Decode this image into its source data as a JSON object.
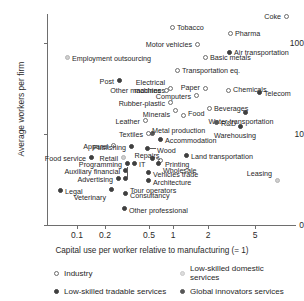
{
  "chart_data": {
    "type": "scatter",
    "title": "",
    "xlabel": "Capital use per worker relative to manufacturing (= 1)",
    "ylabel": "Average workers per firm",
    "xscale": "log",
    "yscale": "log",
    "grid": false,
    "legend_position": "below",
    "xticks": [
      "0.1",
      "0.2",
      "0.5",
      "1",
      "2",
      "5"
    ],
    "xtick_values": [
      0.1,
      0.2,
      0.5,
      1,
      2,
      5
    ],
    "yticks": [
      "0",
      "10",
      "100"
    ],
    "ytick_values": [
      0,
      10,
      100
    ],
    "legend": [
      {
        "key": "industry",
        "label": "Industry"
      },
      {
        "key": "lowdom",
        "label": "Low-skilled domestic services"
      },
      {
        "key": "lowtrade",
        "label": "Low-skilled tradable services"
      },
      {
        "key": "global",
        "label": "Global innovators services"
      }
    ],
    "series": [
      {
        "name": "Industry",
        "key": "industry",
        "points": [
          {
            "label": "Coke",
            "x": 6.8,
            "y": 135,
            "px": 286,
            "py": 16,
            "lx": 281,
            "ly": 13,
            "anchor": "r"
          },
          {
            "label": "Tobacco",
            "x": 0.92,
            "y": 118,
            "px": 172,
            "py": 27,
            "lx": 177,
            "ly": 24,
            "anchor": "l"
          },
          {
            "label": "Pharma",
            "x": 3.0,
            "y": 110,
            "px": 230,
            "py": 33,
            "lx": 235,
            "ly": 30,
            "anchor": "l"
          },
          {
            "label": "Motor vehicles",
            "x": 1.05,
            "y": 95,
            "px": 197,
            "py": 44,
            "lx": 192,
            "ly": 41,
            "anchor": "r"
          },
          {
            "label": "Basic metals",
            "x": 1.65,
            "y": 82,
            "px": 205,
            "py": 57,
            "lx": 210,
            "ly": 54,
            "anchor": "l"
          },
          {
            "label": "Transportation eq.",
            "x": 0.95,
            "y": 68,
            "px": 177,
            "py": 70,
            "lx": 182,
            "ly": 67,
            "anchor": "l"
          },
          {
            "label": "Electrical machines",
            "x": 0.62,
            "y": 48,
            "px": 170,
            "py": 88,
            "lx": 165,
            "ly": 79,
            "anchor": "r2"
          },
          {
            "label": "Paper",
            "x": 1.35,
            "y": 45,
            "px": 205,
            "py": 88,
            "lx": 200,
            "ly": 84,
            "anchor": "r"
          },
          {
            "label": "Other machines",
            "x": 0.58,
            "y": 43,
            "px": 166,
            "py": 90,
            "lx": 161,
            "ly": 87,
            "anchor": "r"
          },
          {
            "label": "Computers",
            "x": 0.78,
            "y": 40,
            "px": 196,
            "py": 95,
            "lx": 191,
            "ly": 93,
            "anchor": "r"
          },
          {
            "label": "Chemicals",
            "x": 2.6,
            "y": 45,
            "px": 228,
            "py": 90,
            "lx": 233,
            "ly": 86,
            "anchor": "l"
          },
          {
            "label": "Rubber-plastic",
            "x": 0.63,
            "y": 30,
            "px": 170,
            "py": 102,
            "lx": 165,
            "ly": 100,
            "anchor": "r"
          },
          {
            "label": "Minerals",
            "x": 0.72,
            "y": 25,
            "px": 175,
            "py": 110,
            "lx": 170,
            "ly": 111,
            "anchor": "r"
          },
          {
            "label": "Food",
            "x": 0.84,
            "y": 22,
            "px": 183,
            "py": 115,
            "lx": 188,
            "ly": 110,
            "anchor": "l"
          },
          {
            "label": "Beverages",
            "x": 1.95,
            "y": 24,
            "px": 209,
            "py": 108,
            "lx": 214,
            "ly": 105,
            "anchor": "l"
          },
          {
            "label": "Leather",
            "x": 0.44,
            "y": 13,
            "px": 145,
            "py": 120,
            "lx": 140,
            "ly": 118,
            "anchor": "r"
          },
          {
            "label": "Textiles",
            "x": 0.45,
            "y": 10.5,
            "px": 148,
            "py": 133,
            "lx": 143,
            "ly": 131,
            "anchor": "r"
          },
          {
            "label": "Apparel",
            "x": 0.3,
            "y": 8.5,
            "px": 113,
            "py": 145,
            "lx": 108,
            "ly": 143,
            "anchor": "r"
          },
          {
            "label": "Printing",
            "x": 0.62,
            "y": 7.0,
            "px": 160,
            "py": 160,
            "lx": 165,
            "ly": 161,
            "anchor": "l"
          }
        ]
      },
      {
        "name": "Low-skilled domestic services",
        "key": "lowdom",
        "points": [
          {
            "label": "Employment outsourcing",
            "x": 0.13,
            "y": 82,
            "px": 67,
            "py": 57,
            "lx": 72,
            "ly": 55,
            "anchor": "l"
          },
          {
            "label": "Leasing",
            "x": 5.9,
            "y": 5.2,
            "px": 277,
            "py": 180,
            "lx": 272,
            "ly": 170,
            "anchor": "r"
          },
          {
            "label": "Retail",
            "x": 0.33,
            "y": 7.2,
            "px": 123,
            "py": 157,
            "lx": 118,
            "ly": 155,
            "anchor": "r"
          }
        ]
      },
      {
        "name": "Low-skilled tradable services",
        "key": "lowtrade",
        "points": [
          {
            "label": "Post",
            "x": 0.24,
            "y": 50,
            "px": 119,
            "py": 80,
            "lx": 114,
            "ly": 78,
            "anchor": "r"
          },
          {
            "label": "Air transportation",
            "x": 2.95,
            "y": 88,
            "px": 229,
            "py": 52,
            "lx": 234,
            "ly": 49,
            "anchor": "l"
          },
          {
            "label": "Telecom",
            "x": 5.0,
            "y": 37,
            "px": 259,
            "py": 92,
            "lx": 264,
            "ly": 90,
            "anchor": "l"
          },
          {
            "label": "Water transportation",
            "x": 3.8,
            "y": 17,
            "px": 245,
            "py": 112,
            "lx": 241,
            "ly": 118,
            "anchor": "c"
          },
          {
            "label": "Warehousing",
            "x": 3.3,
            "y": 12,
            "px": 240,
            "py": 126,
            "lx": 235,
            "ly": 132,
            "anchor": "c"
          },
          {
            "label": "Accommodation",
            "x": 0.57,
            "y": 9.5,
            "px": 160,
            "py": 139,
            "lx": 165,
            "ly": 137,
            "anchor": "l"
          },
          {
            "label": "Wood",
            "x": 0.5,
            "y": 8.0,
            "px": 147,
            "py": 148,
            "lx": 157,
            "ly": 147,
            "anchor": "l"
          },
          {
            "label": "Publishing",
            "x": 0.37,
            "y": 8.4,
            "px": 131,
            "py": 146,
            "lx": 126,
            "ly": 144,
            "anchor": "r"
          },
          {
            "label": "Repairs",
            "x": 0.45,
            "y": 7.3,
            "px": 152,
            "py": 158,
            "lx": 147,
            "ly": 152,
            "anchor": "c"
          },
          {
            "label": "Land transportation",
            "x": 1.2,
            "y": 7.4,
            "px": 186,
            "py": 155,
            "lx": 191,
            "ly": 153,
            "anchor": "l"
          },
          {
            "label": "Food service",
            "x": 0.14,
            "y": 7.0,
            "px": 91,
            "py": 157,
            "lx": 86,
            "ly": 155,
            "anchor": "r"
          },
          {
            "label": "Programming",
            "x": 0.33,
            "y": 6.6,
            "px": 127,
            "py": 163,
            "lx": 122,
            "ly": 161,
            "anchor": "r"
          },
          {
            "label": "IT",
            "x": 0.42,
            "y": 6.6,
            "px": 134,
            "py": 163,
            "lx": 139,
            "ly": 161,
            "anchor": "l"
          },
          {
            "label": "Wholesale",
            "x": 0.64,
            "y": 6.2,
            "px": 158,
            "py": 163,
            "lx": 163,
            "ly": 167,
            "anchor": "l"
          },
          {
            "label": "Auxiliary financial",
            "x": 0.3,
            "y": 5.8,
            "px": 125,
            "py": 170,
            "lx": 120,
            "ly": 168,
            "anchor": "r"
          },
          {
            "label": "Vehicles trade",
            "x": 0.45,
            "y": 5.6,
            "px": 148,
            "py": 172,
            "lx": 153,
            "ly": 171,
            "anchor": "l"
          },
          {
            "label": "Advertising",
            "x": 0.27,
            "y": 5.0,
            "px": 118,
            "py": 178,
            "lx": 113,
            "ly": 176,
            "anchor": "r"
          },
          {
            "label": "Architecture",
            "x": 0.46,
            "y": 4.9,
            "px": 148,
            "py": 180,
            "lx": 153,
            "ly": 179,
            "anchor": "l"
          },
          {
            "label": "Legal",
            "x": 0.075,
            "y": 4.0,
            "px": 60,
            "py": 190,
            "lx": 65,
            "ly": 188,
            "anchor": "l"
          },
          {
            "label": "Veterinary",
            "x": 0.18,
            "y": 4.1,
            "px": 111,
            "py": 189,
            "lx": 106,
            "ly": 194,
            "anchor": "r"
          },
          {
            "label": "Tour operators",
            "x": 0.31,
            "y": 4.3,
            "px": 125,
            "py": 178,
            "lx": 130,
            "ly": 187,
            "anchor": "l"
          },
          {
            "label": "Consultancy",
            "x": 0.32,
            "y": 3.9,
            "px": 125,
            "py": 193,
            "lx": 130,
            "ly": 192,
            "anchor": "l"
          },
          {
            "label": "Other professional",
            "x": 0.33,
            "y": 2.0,
            "px": 124,
            "py": 208,
            "lx": 129,
            "ly": 207,
            "anchor": "l"
          }
        ]
      },
      {
        "name": "Global innovators services",
        "key": "global",
        "points": [
          {
            "label": "R&D",
            "x": 2.1,
            "y": 13,
            "px": 216,
            "py": 122,
            "lx": 221,
            "ly": 120,
            "anchor": "l"
          },
          {
            "label": "Metal production",
            "x": 0.46,
            "y": 10.5,
            "px": 152,
            "py": 133,
            "lx": 152,
            "ly": 127,
            "anchor": "l"
          }
        ]
      }
    ],
    "leaders": [
      {
        "x1": 150,
        "y1": 135,
        "x2": 152,
        "y2": 131
      },
      {
        "x1": 150,
        "y1": 148,
        "x2": 156,
        "y2": 148
      },
      {
        "x1": 152,
        "y1": 158,
        "x2": 150,
        "y2": 156
      },
      {
        "x1": 160,
        "y1": 160,
        "x2": 156,
        "y2": 159
      },
      {
        "x1": 128,
        "y1": 167,
        "x2": 128,
        "y2": 178
      }
    ]
  }
}
